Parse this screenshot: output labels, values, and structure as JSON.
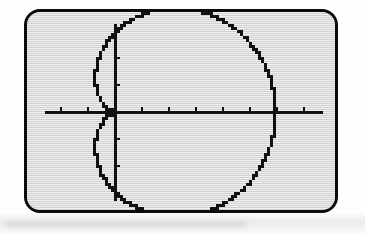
{
  "device": {
    "name": "graphing-calculator-screen",
    "bezel_color": "#0b0b0b",
    "lcd_background": "#dcdcdc",
    "ink_color": "#111111",
    "screen_width_px": 314,
    "screen_height_px": 204
  },
  "chart_data": {
    "type": "line",
    "title": "",
    "subtitle": "",
    "xlabel": "",
    "ylabel": "",
    "plot_mode": "polar",
    "grid": false,
    "legend": null,
    "axes": {
      "show_axes": true,
      "show_ticks": true,
      "origin_px": {
        "x": 88,
        "y": 100
      },
      "tick_spacing_px": 27,
      "xlim": [
        -3.3,
        8.3
      ],
      "ylim": [
        -3.7,
        3.7
      ],
      "xtick_values": [
        -3,
        -2,
        -1,
        0,
        1,
        2,
        3,
        4,
        5,
        6,
        7,
        8
      ],
      "ytick_values": [
        -3,
        -2,
        -1,
        0,
        1,
        2,
        3
      ],
      "x_axis_pixel_y": 100,
      "y_axis_pixel_x": 88,
      "x_axis_extent_px": [
        18,
        296
      ],
      "y_axis_extent_px": [
        12,
        189
      ]
    },
    "series": [
      {
        "name": "r = 3 + 3cos(theta)",
        "kind": "polar-limacon",
        "equation_a": 3.0,
        "equation_b": 3.0,
        "theta_range_deg": [
          0,
          360
        ],
        "theta_step_deg": 2,
        "cusp_point": {
          "x": 0,
          "y": 0
        },
        "max_x": 6.0,
        "max_y": 2.6,
        "min_y": -2.6,
        "rendered_pixelated": true,
        "pixel_size": 3,
        "notes": "cardioid with cusp at origin, opening to the right; gap where curve meets x-axis at far right"
      }
    ],
    "annotations": []
  }
}
